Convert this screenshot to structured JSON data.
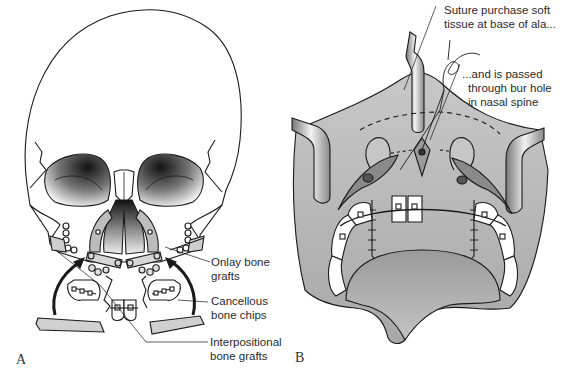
{
  "figure": {
    "panels": [
      {
        "id": "A",
        "letter": "A",
        "subject": "frontal skull with maxillary bone grafts and fixation plates",
        "labels": [
          {
            "line1": "Onlay bone",
            "line2": "grafts"
          },
          {
            "line1": "Cancellous",
            "line2": "bone chips"
          },
          {
            "line1": "Interpositional",
            "line2": "bone grafts"
          }
        ]
      },
      {
        "id": "B",
        "letter": "B",
        "subject": "intraoral view with retractors, suture through nasal spine",
        "labels": [
          {
            "line1": "Suture purchase soft",
            "line2": "tissue at base of ala..."
          },
          {
            "line1": "...and is passed",
            "line2": "through bur hole",
            "line3": "in nasal spine"
          }
        ]
      }
    ],
    "colors": {
      "line": "#1a1a1a",
      "tissue": "#b9b9b9",
      "tissue_dark": "#8f8f8f",
      "orbit_dark": "#1e1e1e",
      "bone": "#ffffff",
      "text": "#2a2a2a"
    }
  }
}
